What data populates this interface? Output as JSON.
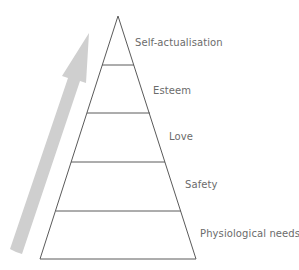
{
  "diagram": {
    "type": "pyramid",
    "title": "",
    "colors": {
      "outline": "#5a5a5a",
      "arrow": "#cfcfcf",
      "label": "#6b6b6b",
      "background": "#ffffff"
    },
    "levels": [
      {
        "rank": 5,
        "label": "Self-actualisation"
      },
      {
        "rank": 4,
        "label": "Esteem"
      },
      {
        "rank": 3,
        "label": "Love"
      },
      {
        "rank": 2,
        "label": "Safety"
      },
      {
        "rank": 1,
        "label": "Physiological needs"
      }
    ],
    "arrow": {
      "direction": "up",
      "meaning": "progression-upward"
    }
  }
}
